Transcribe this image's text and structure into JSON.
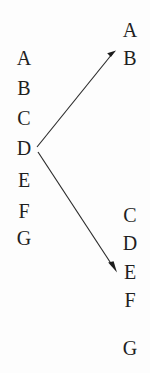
{
  "diagram": {
    "background_color": "#fdfdfd",
    "text_color": "#1f1f1f",
    "arrow_color": "#2b2b2b",
    "left_column": {
      "name": "left-sequence",
      "letters": [
        "A",
        "B",
        "C",
        "D",
        "E",
        "F",
        "G"
      ],
      "x": 14,
      "start_y": 48,
      "spacing": 30
    },
    "right_column": {
      "name": "right-sequence",
      "letters": [
        "A",
        "B",
        "C",
        "D",
        "E",
        "F",
        "G"
      ],
      "x": 120,
      "positions_y": [
        20,
        48,
        205,
        233,
        262,
        290,
        338
      ]
    },
    "arrows": [
      {
        "name": "arrow-d-to-b",
        "from_letter": "D",
        "to_letter": "B",
        "x1": 37,
        "y1": 147,
        "x2": 115,
        "y2": 51
      },
      {
        "name": "arrow-d-to-e",
        "from_letter": "D",
        "to_letter": "E",
        "x1": 38,
        "y1": 152,
        "x2": 116,
        "y2": 271
      }
    ]
  }
}
